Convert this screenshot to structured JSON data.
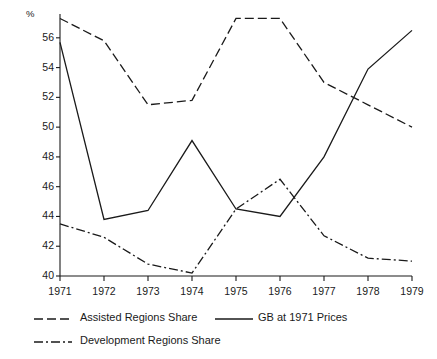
{
  "chart_data": {
    "type": "line",
    "title": "",
    "xlabel": "",
    "ylabel": "%",
    "y_unit_symbol": "%",
    "x": [
      "1971",
      "1972",
      "1973",
      "1974",
      "1975",
      "1976",
      "1977",
      "1978",
      "1979"
    ],
    "categories": [
      "1971",
      "1972",
      "1973",
      "1974",
      "1975",
      "1976",
      "1977",
      "1978",
      "1979"
    ],
    "xlim": [
      1971,
      1979
    ],
    "ylim": [
      40,
      57.6
    ],
    "yticks": [
      40,
      42,
      44,
      46,
      48,
      50,
      52,
      54,
      56
    ],
    "ytick_labels": [
      "40",
      "42",
      "44",
      "46",
      "48",
      "50",
      "52",
      "54",
      "56"
    ],
    "grid": false,
    "legend_position": "below-axes-left",
    "series": [
      {
        "name": "Assisted Regions Share",
        "style": "dashed",
        "color": "#1a1a1a",
        "values": [
          57.3,
          55.8,
          51.5,
          51.8,
          57.3,
          57.3,
          53.0,
          51.5,
          50.0
        ]
      },
      {
        "name": "GB at 1971 Prices",
        "style": "solid",
        "color": "#1a1a1a",
        "values": [
          55.7,
          43.8,
          44.4,
          49.1,
          44.5,
          44.0,
          48.0,
          53.9,
          56.5
        ]
      },
      {
        "name": "Development Regions Share",
        "style": "dash-dot",
        "color": "#1a1a1a",
        "values": [
          43.5,
          42.6,
          40.8,
          40.2,
          44.5,
          46.5,
          42.7,
          41.2,
          41.0
        ]
      }
    ]
  },
  "axis": {
    "unit_symbol": "%",
    "y_labels": [
      "56",
      "54",
      "52",
      "50",
      "48",
      "46",
      "44",
      "42",
      "40"
    ],
    "x_labels": [
      "1971",
      "1972",
      "1973",
      "1974",
      "1975",
      "1976",
      "1977",
      "1978",
      "1979"
    ]
  },
  "legend": {
    "items": [
      {
        "label": "Assisted Regions Share",
        "style": "dashed"
      },
      {
        "label": "GB at 1971 Prices",
        "style": "solid"
      },
      {
        "label": "Development Regions Share",
        "style": "dash-dot"
      }
    ]
  }
}
